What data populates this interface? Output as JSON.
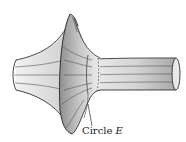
{
  "figure": {
    "label": {
      "prefix": "Circle ",
      "name": "E"
    },
    "colors": {
      "stroke": "#333333",
      "shade_dark": "#9a9a9a",
      "shade_mid": "#c4c4c4",
      "shade_light": "#efefef",
      "background": "#ffffff"
    }
  }
}
